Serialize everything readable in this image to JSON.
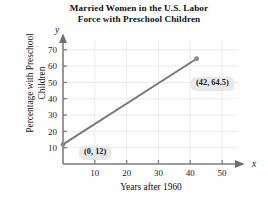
{
  "chart_data": {
    "type": "line",
    "title": "Married Women in the U.S. Labor\nForce with Preschool Children",
    "xlabel": "Years after 1960",
    "ylabel": "Percentage with Preschool\nChildren",
    "x_axis_variable": "x",
    "y_axis_variable": "y",
    "xlim": [
      0,
      55
    ],
    "ylim": [
      0,
      76
    ],
    "xticks": [
      10,
      20,
      30,
      40,
      50
    ],
    "yticks": [
      10,
      20,
      30,
      40,
      50,
      60,
      70
    ],
    "xtick_labels": [
      "10",
      "20",
      "30",
      "40",
      "50"
    ],
    "ytick_labels": [
      "10",
      "20",
      "30",
      "40",
      "50",
      "60",
      "70"
    ],
    "grid": true,
    "legend": "none",
    "series": [
      {
        "name": "Percentage with Preschool Children",
        "x": [
          0,
          42
        ],
        "values": [
          12,
          64.5
        ],
        "color": "#7a7a7a",
        "marker": "circle"
      }
    ],
    "annotations": [
      {
        "label": "(0, 12)",
        "x": 0,
        "y": 12
      },
      {
        "label": "(42, 64.5)",
        "x": 42,
        "y": 64.5
      }
    ]
  },
  "colors": {
    "line": "#7a7a7a",
    "marker": "#8a8a8a",
    "axis": "#7d7d7d",
    "grid": "#eceaea",
    "callout_background": "#e9e9e9",
    "text": "#1a1a1a"
  }
}
